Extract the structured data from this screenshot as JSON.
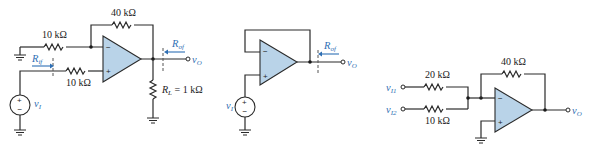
{
  "figure": {
    "circuit_a": {
      "feedback_resistor": "40 kΩ",
      "inverting_resistor": "10 kΩ",
      "noninverting_resistor": "10 kΩ",
      "load_resistor": "R",
      "load_resistor_sub": "L",
      "load_resistor_value": " = 1 kΩ",
      "input_resistance": "R",
      "input_resistance_sub": "if",
      "output_resistance": "R",
      "output_resistance_sub": "of",
      "source": "v",
      "source_sub": "I",
      "output": "v",
      "output_sub": "O",
      "opamp_minus": "−",
      "opamp_plus": "+",
      "source_plus": "+",
      "source_minus": "−"
    },
    "circuit_b": {
      "output_resistance": "R",
      "output_resistance_sub": "of",
      "source": "v",
      "source_sub": "I",
      "output": "v",
      "output_sub": "O",
      "opamp_minus": "−",
      "opamp_plus": "+",
      "source_plus": "+",
      "source_minus": "−"
    },
    "circuit_c": {
      "feedback_resistor": "40 kΩ",
      "input1_resistor": "20 kΩ",
      "input2_resistor": "10 kΩ",
      "input1": "v",
      "input1_sub": "I1",
      "input2": "v",
      "input2_sub": "I2",
      "output": "v",
      "output_sub": "O",
      "opamp_minus": "−",
      "opamp_plus": "+"
    },
    "colors": {
      "opamp_fill": "#b9d3e8",
      "label_blue": "#2f6fb4",
      "wire": "#2a2a2a"
    }
  }
}
